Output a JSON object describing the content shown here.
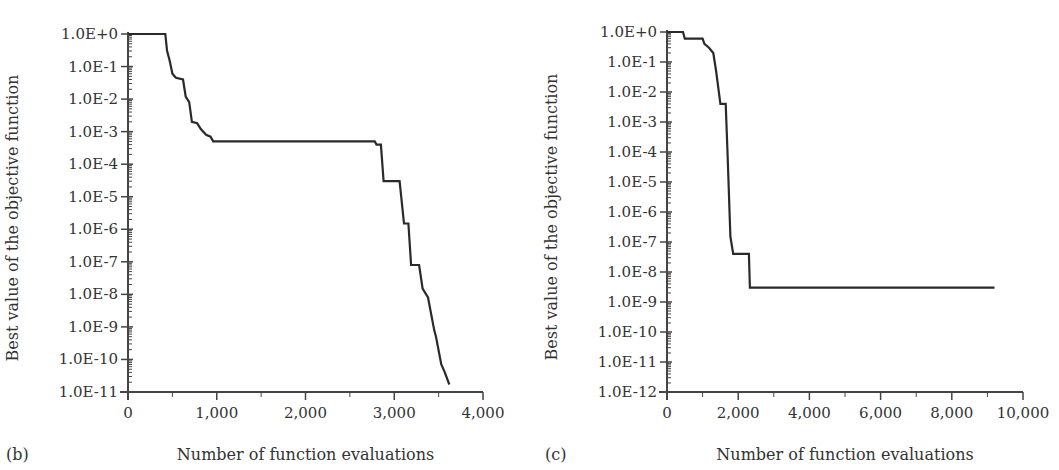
{
  "chart_data": [
    {
      "type": "line",
      "panel_label": "(b)",
      "title": "",
      "xlabel": "Number of function evaluations",
      "ylabel": "Best value of the objective function",
      "yscale": "log",
      "xlim": [
        0,
        4000
      ],
      "ylim": [
        1e-11,
        1
      ],
      "xticks": [
        0,
        1000,
        2000,
        3000,
        4000
      ],
      "xtick_labels": [
        "0",
        "1,000",
        "2,000",
        "3,000",
        "4,000"
      ],
      "yticks_exp": [
        0,
        -1,
        -2,
        -3,
        -4,
        -5,
        -6,
        -7,
        -8,
        -9,
        -10,
        -11
      ],
      "ytick_labels": [
        "1.0E+0",
        "1.0E-1",
        "1.0E-2",
        "1.0E-3",
        "1.0E-4",
        "1.0E-5",
        "1.0E-6",
        "1.0E-7",
        "1.0E-8",
        "1.0E-9",
        "1.0E-10",
        "1.0E-11"
      ],
      "grid": false,
      "series": [
        {
          "name": "best value",
          "points": [
            [
              0,
              1.0
            ],
            [
              420,
              1.0
            ],
            [
              440,
              0.3
            ],
            [
              470,
              0.15
            ],
            [
              500,
              0.06
            ],
            [
              540,
              0.045
            ],
            [
              620,
              0.04
            ],
            [
              650,
              0.012
            ],
            [
              690,
              0.008
            ],
            [
              720,
              0.002
            ],
            [
              780,
              0.0018
            ],
            [
              820,
              0.0012
            ],
            [
              880,
              0.0008
            ],
            [
              930,
              0.0007
            ],
            [
              960,
              0.0005
            ],
            [
              2780,
              0.0005
            ],
            [
              2800,
              0.0004
            ],
            [
              2850,
              0.0004
            ],
            [
              2880,
              3e-05
            ],
            [
              3060,
              3e-05
            ],
            [
              3110,
              1.5e-06
            ],
            [
              3160,
              1.5e-06
            ],
            [
              3190,
              8e-08
            ],
            [
              3280,
              8e-08
            ],
            [
              3320,
              1.5e-08
            ],
            [
              3380,
              8e-09
            ],
            [
              3450,
              8e-10
            ],
            [
              3470,
              5e-10
            ],
            [
              3530,
              7e-11
            ],
            [
              3570,
              4e-11
            ],
            [
              3620,
              1.7e-11
            ]
          ]
        }
      ]
    },
    {
      "type": "line",
      "panel_label": "(c)",
      "title": "",
      "xlabel": "Number of function evaluations",
      "ylabel": "Best value of the objective function",
      "yscale": "log",
      "xlim": [
        0,
        10000
      ],
      "ylim": [
        1e-12,
        1
      ],
      "xticks": [
        0,
        2000,
        4000,
        6000,
        8000,
        10000
      ],
      "xtick_labels": [
        "0",
        "2,000",
        "4,000",
        "6,000",
        "8,000",
        "10,000"
      ],
      "yticks_exp": [
        0,
        -1,
        -2,
        -3,
        -4,
        -5,
        -6,
        -7,
        -8,
        -9,
        -10,
        -11,
        -12
      ],
      "ytick_labels": [
        "1.0E+0",
        "1.0E-1",
        "1.0E-2",
        "1.0E-3",
        "1.0E-4",
        "1.0E-5",
        "1.0E-6",
        "1.0E-7",
        "1.0E-8",
        "1.0E-9",
        "1.0E-10",
        "1.0E-11",
        "1.0E-12"
      ],
      "grid": false,
      "series": [
        {
          "name": "best value",
          "points": [
            [
              0,
              1.0
            ],
            [
              450,
              1.0
            ],
            [
              500,
              0.6
            ],
            [
              1000,
              0.6
            ],
            [
              1050,
              0.4
            ],
            [
              1180,
              0.3
            ],
            [
              1300,
              0.2
            ],
            [
              1380,
              0.05
            ],
            [
              1500,
              0.004
            ],
            [
              1650,
              0.004
            ],
            [
              1700,
              0.0001
            ],
            [
              1780,
              1.5e-07
            ],
            [
              1860,
              4e-08
            ],
            [
              2300,
              4e-08
            ],
            [
              2330,
              3e-09
            ],
            [
              9200,
              3e-09
            ]
          ]
        }
      ]
    }
  ],
  "geometry": {
    "left": {
      "x0": 128,
      "x1": 483,
      "y_top": 34,
      "y_bottom": 392
    },
    "right": {
      "x0": 667,
      "x1": 1023,
      "y_top": 32,
      "y_bottom": 392
    }
  },
  "colors": {
    "line": "#2a2a2a",
    "axis": "#444444",
    "text": "#333333"
  }
}
